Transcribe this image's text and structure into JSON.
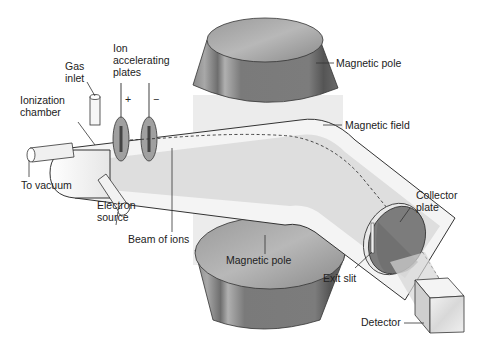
{
  "labels": {
    "ionization_chamber": [
      "Ionization",
      "chamber"
    ],
    "gas_inlet": [
      "Gas",
      "inlet"
    ],
    "ion_accelerating_plates": [
      "Ion",
      "accelerating",
      "plates"
    ],
    "plus_sign": "+",
    "minus_sign": "−",
    "to_vacuum": "To vacuum",
    "electron_source": [
      "Electron",
      "source"
    ],
    "beam_of_ions": "Beam of ions",
    "magnetic_pole_top": "Magnetic pole",
    "magnetic_field": "Magnetic field",
    "magnetic_pole_bottom": "Magnetic pole",
    "collector_plate": [
      "Collector",
      "plate"
    ],
    "exit_slit": "Exit slit",
    "detector": "Detector"
  },
  "colors": {
    "tube_fill": "#f4f4f4",
    "tube_outline": "#333333",
    "beam": "#d9d9d9",
    "field_region": "#ececec",
    "pole_dark": "#6e6e6e",
    "pole_mid": "#8c8c8c",
    "pole_light": "#b5b5b5",
    "plate": "#a0a0a0"
  }
}
